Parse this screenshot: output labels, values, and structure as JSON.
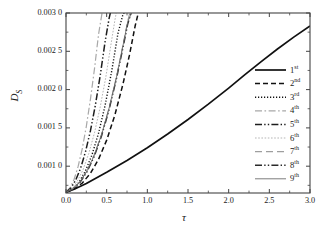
{
  "chart_data": {
    "type": "line",
    "title": "",
    "xlabel": "τ",
    "ylabel": "D_S",
    "xlim": [
      0.0,
      3.0
    ],
    "ylim": [
      0.00065,
      0.003
    ],
    "grid": false,
    "legend_position": "right-inside",
    "xticks": [
      "0.0",
      "0.5",
      "1.0",
      "1.5",
      "2.0",
      "2.5",
      "3.0"
    ],
    "xtick_values": [
      0.0,
      0.5,
      1.0,
      1.5,
      2.0,
      2.5,
      3.0
    ],
    "yticks": [
      "0.001 0",
      "0.001 5",
      "0.002 0",
      "0.002 5",
      "0.003 0"
    ],
    "ytick_values": [
      0.001,
      0.0015,
      0.002,
      0.0025,
      0.003
    ],
    "series": [
      {
        "name": "1st",
        "label_base": "1",
        "label_sup": "st",
        "style": "solid",
        "width": 1.7,
        "color": "#111111",
        "x": [
          0.0,
          0.1,
          0.25,
          0.5,
          0.75,
          1.0,
          1.25,
          1.5,
          1.75,
          2.0,
          2.2,
          2.4,
          2.6,
          2.8,
          3.0
        ],
        "y": [
          0.00066,
          0.0007,
          0.000775,
          0.00092,
          0.001075,
          0.00124,
          0.00142,
          0.00161,
          0.00181,
          0.00202,
          0.002195,
          0.002365,
          0.00253,
          0.002685,
          0.00283
        ]
      },
      {
        "name": "2nd",
        "label_base": "2",
        "label_sup": "nd",
        "style": "dashed",
        "width": 1.5,
        "color": "#111111",
        "x": [
          0.0,
          0.1,
          0.2,
          0.3,
          0.4,
          0.5,
          0.6,
          0.7,
          0.78,
          0.85,
          0.9
        ],
        "y": [
          0.00066,
          0.0007,
          0.00078,
          0.000905,
          0.00109,
          0.00134,
          0.001665,
          0.00207,
          0.00245,
          0.00283,
          0.00305
        ]
      },
      {
        "name": "3rd",
        "label_base": "3",
        "label_sup": "rd",
        "style": "dotted",
        "width": 1.4,
        "color": "#111111",
        "x": [
          0.0,
          0.08,
          0.16,
          0.24,
          0.32,
          0.4,
          0.48,
          0.56,
          0.64,
          0.7,
          0.75
        ],
        "y": [
          0.00066,
          0.0007,
          0.00079,
          0.00094,
          0.00115,
          0.00143,
          0.00179,
          0.00223,
          0.00274,
          0.00298,
          0.00306
        ]
      },
      {
        "name": "4th",
        "label_base": "4",
        "label_sup": "th",
        "style": "dashdot",
        "width": 1.2,
        "color": "#a8a8a8",
        "x": [
          0.0,
          0.05,
          0.1,
          0.15,
          0.2,
          0.25,
          0.3,
          0.35,
          0.4,
          0.44,
          0.47
        ],
        "y": [
          0.00066,
          0.00072,
          0.00083,
          0.001,
          0.00123,
          0.00152,
          0.00187,
          0.00227,
          0.00272,
          0.00298,
          0.00308
        ]
      },
      {
        "name": "5th",
        "label_base": "5",
        "label_sup": "th",
        "style": "dashdotdot",
        "width": 1.5,
        "color": "#1d1d1d",
        "x": [
          0.0,
          0.06,
          0.12,
          0.18,
          0.24,
          0.3,
          0.36,
          0.42,
          0.48,
          0.53,
          0.56
        ],
        "y": [
          0.00066,
          0.000715,
          0.00082,
          0.000975,
          0.00119,
          0.00146,
          0.00179,
          0.00218,
          0.00262,
          0.00293,
          0.00307
        ]
      },
      {
        "name": "6th",
        "label_base": "6",
        "label_sup": "th",
        "style": "finedot",
        "width": 1.0,
        "color": "#b5b5b5",
        "x": [
          0.0,
          0.07,
          0.14,
          0.21,
          0.28,
          0.35,
          0.42,
          0.49,
          0.55,
          0.6,
          0.63
        ],
        "y": [
          0.00066,
          0.00071,
          0.000805,
          0.000955,
          0.001165,
          0.001435,
          0.00177,
          0.002165,
          0.00257,
          0.0029,
          0.00307
        ]
      },
      {
        "name": "7th",
        "label_base": "7",
        "label_sup": "th",
        "style": "longdash",
        "width": 1.1,
        "color": "#9e9e9e",
        "x": [
          0.0,
          0.08,
          0.17,
          0.26,
          0.35,
          0.44,
          0.53,
          0.62,
          0.7,
          0.76,
          0.8
        ],
        "y": [
          0.00066,
          0.000705,
          0.000795,
          0.000945,
          0.001155,
          0.001425,
          0.00176,
          0.00216,
          0.00258,
          0.0029,
          0.00307
        ]
      },
      {
        "name": "8th",
        "label_base": "8",
        "label_sup": "th",
        "style": "dashdotdot",
        "width": 1.4,
        "color": "#2a2a2a",
        "x": [
          0.0,
          0.08,
          0.17,
          0.26,
          0.35,
          0.44,
          0.53,
          0.62,
          0.7,
          0.76,
          0.82
        ],
        "y": [
          0.00066,
          0.0007,
          0.000785,
          0.00093,
          0.001135,
          0.001405,
          0.00174,
          0.00214,
          0.002545,
          0.00286,
          0.00307
        ]
      },
      {
        "name": "9th",
        "label_base": "9",
        "label_sup": "th",
        "style": "solid",
        "width": 0.9,
        "color": "#6e6e6e",
        "x": [
          0.0,
          0.08,
          0.17,
          0.26,
          0.35,
          0.44,
          0.53,
          0.62,
          0.7,
          0.76,
          0.84
        ],
        "y": [
          0.00066,
          0.0007,
          0.00079,
          0.00094,
          0.00115,
          0.00142,
          0.00176,
          0.00216,
          0.00257,
          0.00289,
          0.00308
        ]
      }
    ]
  },
  "axes": {
    "frame_color": "#444444"
  }
}
